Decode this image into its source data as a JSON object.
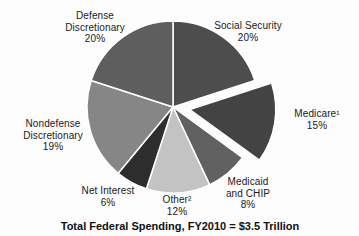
{
  "chart_data": {
    "type": "pie",
    "title": "Total Federal Spending, FY2010 = $3.5 Trillion",
    "total_label": "$3.5 Trillion",
    "slices": [
      {
        "label": "Social Security",
        "value": 20,
        "color": "#4d4d4d",
        "exploded": false
      },
      {
        "label": "Medicare¹",
        "value": 15,
        "color": "#434343",
        "exploded": true
      },
      {
        "label": "Medicaid and CHIP",
        "value": 8,
        "color": "#616161",
        "exploded": false
      },
      {
        "label": "Other²",
        "value": 12,
        "color": "#c3c3c3",
        "exploded": false
      },
      {
        "label": "Net Interest",
        "value": 6,
        "color": "#2d2d2d",
        "exploded": false
      },
      {
        "label": "Nondefense Discretionary",
        "value": 19,
        "color": "#868686",
        "exploded": false
      },
      {
        "label": "Defense Discretionary",
        "value": 20,
        "color": "#5e5e5e",
        "exploded": false
      }
    ],
    "legend_position": "none",
    "label_style": "outside-callouts"
  },
  "labels": {
    "defense": "Defense\nDiscretionary\n20%",
    "social_security": "Social Security\n20%",
    "medicare": "Medicare¹\n15%",
    "nondefense": "Nondefense\nDiscretionary\n19%",
    "net_interest": "Net Interest\n6%",
    "other": "Other²\n12%",
    "medicaid": "Medicaid\nand CHIP\n8%",
    "title": "Total Federal Spending, FY2010 = $3.5 Trillion"
  }
}
